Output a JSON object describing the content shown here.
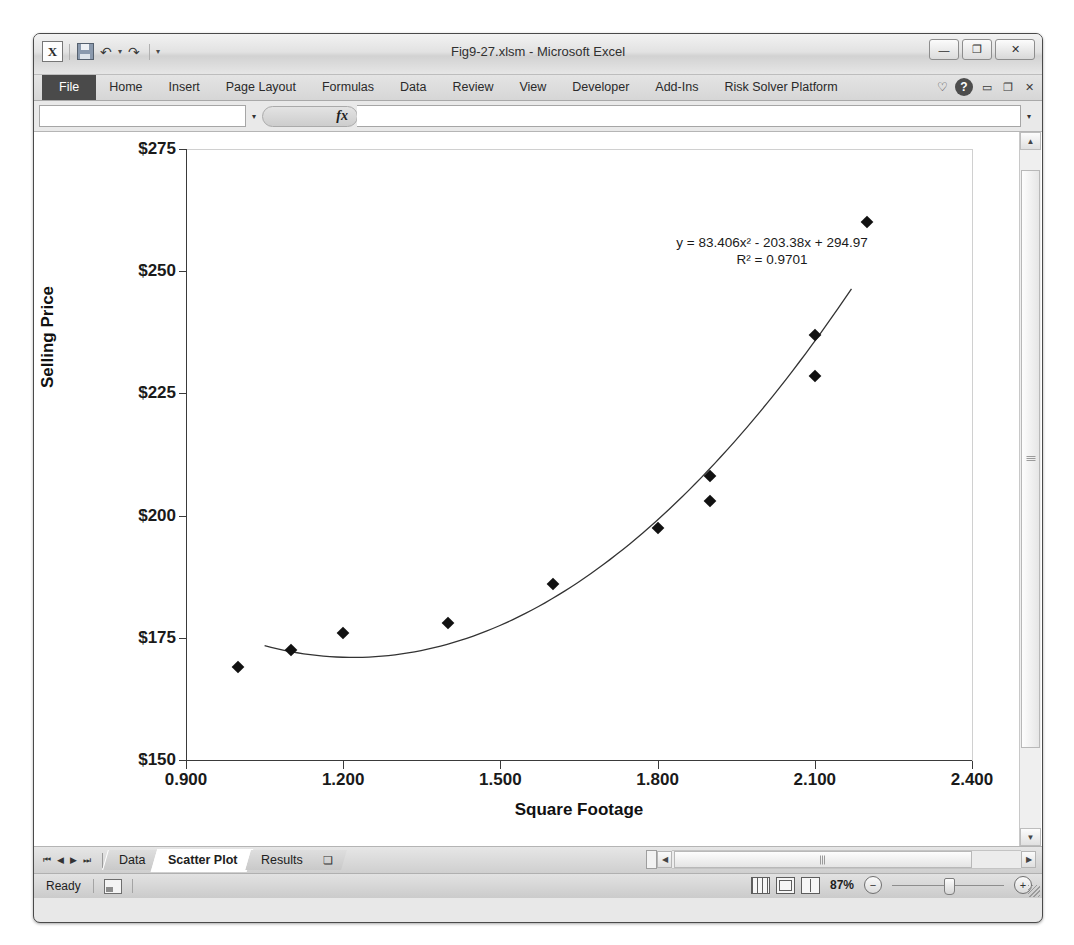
{
  "window": {
    "title": "Fig9-27.xlsm - Microsoft Excel",
    "logo": "excel-logo",
    "minimize": "—",
    "restore": "❐",
    "close": "✕"
  },
  "quick_access": {
    "save": "save-icon",
    "undo": "↶",
    "undo_caret": "▾",
    "redo": "↷",
    "more_caret": "▾"
  },
  "ribbon": {
    "tabs": [
      {
        "label": "File",
        "active": true
      },
      {
        "label": "Home",
        "active": false
      },
      {
        "label": "Insert",
        "active": false
      },
      {
        "label": "Page Layout",
        "active": false
      },
      {
        "label": "Formulas",
        "active": false
      },
      {
        "label": "Data",
        "active": false
      },
      {
        "label": "Review",
        "active": false
      },
      {
        "label": "View",
        "active": false
      },
      {
        "label": "Developer",
        "active": false
      },
      {
        "label": "Add-Ins",
        "active": false
      },
      {
        "label": "Risk Solver Platform",
        "active": false
      }
    ],
    "heart": "♡",
    "help": "?",
    "minimize_ribbon": "▭",
    "restore_window": "❐",
    "close_window": "✕"
  },
  "formula_bar": {
    "name_box_value": "",
    "name_box_caret": "▾",
    "fx_label": "fx",
    "formula_value": "",
    "expand_caret": "▾"
  },
  "chart_data": {
    "type": "scatter",
    "title": "",
    "xlabel": "Square Footage",
    "ylabel": "Selling Price",
    "xlim": [
      0.9,
      2.4
    ],
    "ylim": [
      150,
      275
    ],
    "xticks": [
      "0.900",
      "1.200",
      "1.500",
      "1.800",
      "2.100",
      "2.400"
    ],
    "xtick_values": [
      0.9,
      1.2,
      1.5,
      1.8,
      2.1,
      2.4
    ],
    "yticks": [
      "$150",
      "$175",
      "$200",
      "$225",
      "$250",
      "$275"
    ],
    "ytick_values": [
      150,
      175,
      200,
      225,
      250,
      275
    ],
    "grid": false,
    "legend": "none",
    "marker": "diamond",
    "marker_color": "#111111",
    "trendline_color": "#333333",
    "points": [
      {
        "x": 1.0,
        "y": 169.0
      },
      {
        "x": 1.1,
        "y": 172.5
      },
      {
        "x": 1.2,
        "y": 176.0
      },
      {
        "x": 1.4,
        "y": 178.0
      },
      {
        "x": 1.6,
        "y": 186.0
      },
      {
        "x": 1.8,
        "y": 197.5
      },
      {
        "x": 1.9,
        "y": 203.0
      },
      {
        "x": 1.9,
        "y": 208.0
      },
      {
        "x": 2.1,
        "y": 228.5
      },
      {
        "x": 2.1,
        "y": 237.0
      },
      {
        "x": 2.2,
        "y": 260.0
      }
    ],
    "trendline": {
      "type": "polynomial",
      "order": 2,
      "a": 83.406,
      "b": -203.38,
      "c": 294.97,
      "equation": "y = 83.406x² - 203.38x + 294.97",
      "r_squared_label": "R² = 0.9701",
      "r_squared": 0.9701,
      "x_start": 1.05,
      "x_end": 2.17
    }
  },
  "sheet_tabs": {
    "nav_first": "⏮",
    "nav_prev": "◀",
    "nav_next": "▶",
    "nav_last": "⏭",
    "tabs": [
      {
        "label": "Data",
        "active": false
      },
      {
        "label": "Scatter Plot",
        "active": true
      },
      {
        "label": "Results",
        "active": false
      }
    ],
    "new_sheet": "❏"
  },
  "scrollbars": {
    "v_up": "▲",
    "v_down": "▼",
    "h_left": "◀",
    "h_right": "▶"
  },
  "status_bar": {
    "ready": "Ready",
    "macro_record": "record-macro-icon",
    "view_normal": "normal-view-icon",
    "view_page_layout": "page-layout-view-icon",
    "view_page_break": "page-break-view-icon",
    "zoom": "87%",
    "zoom_out": "−",
    "zoom_in": "+"
  }
}
